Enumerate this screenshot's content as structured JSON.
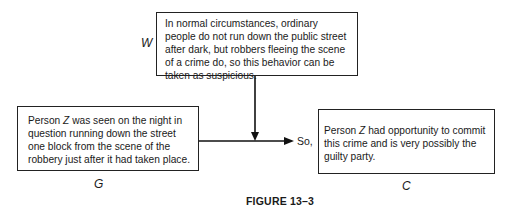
{
  "figure": {
    "caption": "FIGURE 13–3",
    "warrant": {
      "label": "W",
      "text": "In normal circumstances, ordinary people do not run down the public street after dark, but robbers fleeing the scene of a crime do, so this behavior can be taken as suspicious."
    },
    "grounds": {
      "label": "G",
      "text_before": "Person ",
      "z": "Z",
      "text_after": " was seen on the night in question running down the street one block from the scene of the robbery just after it had taken place."
    },
    "connector": "So,",
    "claim": {
      "label": "C",
      "text_before": "Person ",
      "z": "Z",
      "text_after": " had opportunity to commit this crime and is very possibly the guilty party."
    }
  }
}
